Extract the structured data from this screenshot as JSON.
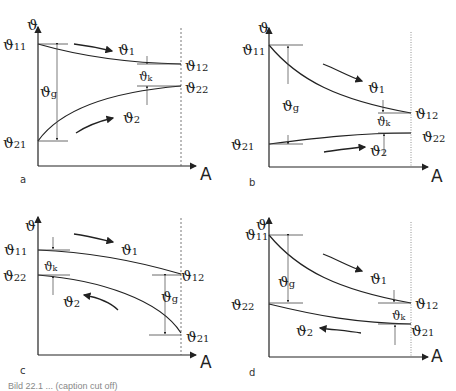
{
  "figure": {
    "axis_y_symbol": "ϑ",
    "axis_x_symbol": "A",
    "panels": [
      {
        "id": "a",
        "label": "a",
        "flow": "co-current",
        "labels": {
          "t11": "11",
          "t12": "12",
          "t21": "21",
          "t22": "22",
          "g": "g",
          "k": "k",
          "flow1": "1",
          "flow2": "2"
        }
      },
      {
        "id": "b",
        "label": "b",
        "flow": "co-current",
        "labels": {
          "t11": "11",
          "t12": "12",
          "t21": "21",
          "t22": "22",
          "g": "g",
          "k": "k",
          "flow1": "1",
          "flow2": "2"
        }
      },
      {
        "id": "c",
        "label": "c",
        "flow": "counter-current",
        "labels": {
          "t11": "11",
          "t12": "12",
          "t21": "21",
          "t22": "22",
          "g": "g",
          "k": "k",
          "flow1": "1",
          "flow2": "2"
        }
      },
      {
        "id": "d",
        "label": "d",
        "flow": "counter-current",
        "labels": {
          "t11": "11",
          "t12": "12",
          "t21": "21",
          "t22": "22",
          "g": "g",
          "k": "k",
          "flow1": "1",
          "flow2": "2"
        }
      }
    ]
  },
  "caption": "Bild 22.1 ... (caption cut off)"
}
